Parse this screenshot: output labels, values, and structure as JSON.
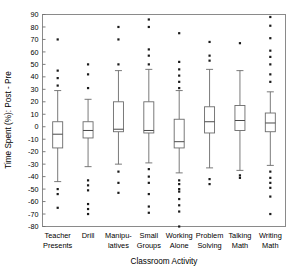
{
  "chart_data": {
    "type": "box",
    "title": "",
    "xlabel": "Classroom Activity",
    "ylabel": "Time Spent (%): Post - Pre",
    "ylim": [
      -80,
      90
    ],
    "yticks": [
      90,
      80,
      70,
      60,
      50,
      40,
      30,
      20,
      10,
      0,
      -10,
      -20,
      -30,
      -40,
      -50,
      -60,
      -70,
      -80
    ],
    "ytick_labels": [
      "90",
      "80",
      "70",
      "60",
      "50",
      "40",
      "30",
      "20",
      "10",
      "0",
      "-10",
      "-20",
      "-30",
      "-40",
      "-50",
      "-60",
      "-70",
      "-80"
    ],
    "grid": false,
    "legend": "none",
    "categories": [
      "Teacher Presents",
      "Drill",
      "Manipu- latives",
      "Small Groups",
      "Working Alone",
      "Problem Solving",
      "Talking Math",
      "Writing Math"
    ],
    "category_lines": [
      [
        "Teacher",
        "Presents"
      ],
      [
        "Drill",
        ""
      ],
      [
        "Manipu-",
        "latives"
      ],
      [
        "Small",
        "Groups"
      ],
      [
        "Working",
        "Alone"
      ],
      [
        "Problem",
        "Solving"
      ],
      [
        "Talking",
        "Math"
      ],
      [
        "Writing",
        "Math"
      ]
    ],
    "boxes": [
      {
        "name": "Teacher Presents",
        "whisker_low": -44,
        "q1": -17,
        "median": -6,
        "q3": 4,
        "whisker_high": 29,
        "outliers": [
          70,
          45,
          39,
          33,
          -50,
          -54,
          -65
        ]
      },
      {
        "name": "Drill",
        "whisker_low": -32,
        "q1": -9,
        "median": -3,
        "q3": 4,
        "whisker_high": 22,
        "outliers": [
          50,
          42,
          31,
          -43,
          -47,
          -51,
          -62,
          -66,
          -70
        ]
      },
      {
        "name": "Manipulatives",
        "whisker_low": -30,
        "q1": -4,
        "median": -2,
        "q3": 20,
        "whisker_high": 45,
        "outliers": [
          80,
          70,
          50,
          -36,
          -45,
          -53
        ]
      },
      {
        "name": "Small Groups",
        "whisker_low": -29,
        "q1": -5,
        "median": -3,
        "q3": 20,
        "whisker_high": 46,
        "outliers": [
          86,
          80,
          62,
          57,
          50,
          -34,
          -40,
          -45,
          -54,
          -64,
          -69
        ]
      },
      {
        "name": "Working Alone",
        "whisker_low": -37,
        "q1": -17,
        "median": -12,
        "q3": 6,
        "whisker_high": 29,
        "outliers": [
          75,
          52,
          46,
          41,
          36,
          31,
          -43,
          -46,
          -50,
          -52,
          -58,
          -63,
          -68,
          -80
        ]
      },
      {
        "name": "Problem Solving",
        "whisker_low": -33,
        "q1": -5,
        "median": 4,
        "q3": 16,
        "whisker_high": 46,
        "outliers": [
          68,
          57,
          53,
          -42,
          -46
        ]
      },
      {
        "name": "Talking Math",
        "whisker_low": -35,
        "q1": -3,
        "median": 5,
        "q3": 17,
        "whisker_high": 45,
        "outliers": [
          67,
          -39,
          -41
        ]
      },
      {
        "name": "Writing Math",
        "whisker_low": -31,
        "q1": -4,
        "median": 3,
        "q3": 11,
        "whisker_high": 28,
        "outliers": [
          88,
          81,
          71,
          61,
          56,
          50,
          42,
          36,
          -36,
          -41,
          -45,
          -49,
          -56,
          -70
        ]
      }
    ]
  }
}
